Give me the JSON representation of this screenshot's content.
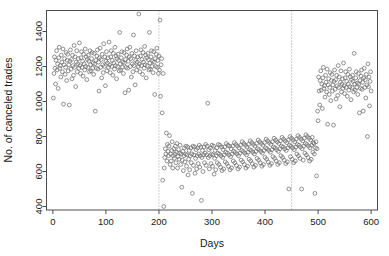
{
  "chart_data": {
    "type": "scatter",
    "title": "",
    "xlabel": "Days",
    "ylabel": "No. of canceled trades",
    "xlim": [
      -12,
      612
    ],
    "ylim": [
      380,
      1520
    ],
    "xticks": [
      0,
      100,
      200,
      300,
      400,
      500,
      600
    ],
    "yticks": [
      400,
      600,
      800,
      1000,
      1200,
      1400
    ],
    "grid": false,
    "legend": null,
    "point_style": {
      "marker": "open-circle",
      "radius": 1.9,
      "stroke": "#6e6e6e",
      "fill": "none"
    },
    "annotations": [
      {
        "type": "vline",
        "x": 200,
        "style": "dotted",
        "color": "#8a8a8a",
        "label": "changepoint-1"
      },
      {
        "type": "vline",
        "x": 450,
        "style": "dotted",
        "color": "#8a8a8a",
        "label": "changepoint-2"
      }
    ],
    "segments": [
      {
        "name": "regime-1",
        "x_range": [
          1,
          200
        ],
        "mean": 1200,
        "sd": 95
      },
      {
        "name": "regime-2",
        "x_range": [
          201,
          450
        ],
        "mean": 680,
        "sd": 78
      },
      {
        "name": "regime-3",
        "x_range": [
          451,
          600
        ],
        "mean": 1020,
        "sd": 90
      }
    ],
    "x": [
      1,
      2,
      3,
      4,
      5,
      6,
      7,
      8,
      9,
      10,
      11,
      12,
      13,
      14,
      15,
      16,
      17,
      18,
      19,
      20,
      21,
      22,
      23,
      24,
      25,
      26,
      27,
      28,
      29,
      30,
      31,
      32,
      33,
      34,
      35,
      36,
      37,
      38,
      39,
      40,
      41,
      42,
      43,
      44,
      45,
      46,
      47,
      48,
      49,
      50,
      51,
      52,
      53,
      54,
      55,
      56,
      57,
      58,
      59,
      60,
      61,
      62,
      63,
      64,
      65,
      66,
      67,
      68,
      69,
      70,
      71,
      72,
      73,
      74,
      75,
      76,
      77,
      78,
      79,
      80,
      81,
      82,
      83,
      84,
      85,
      86,
      87,
      88,
      89,
      90,
      91,
      92,
      93,
      94,
      95,
      96,
      97,
      98,
      99,
      100,
      101,
      102,
      103,
      104,
      105,
      106,
      107,
      108,
      109,
      110,
      111,
      112,
      113,
      114,
      115,
      116,
      117,
      118,
      119,
      120,
      121,
      122,
      123,
      124,
      125,
      126,
      127,
      128,
      129,
      130,
      131,
      132,
      133,
      134,
      135,
      136,
      137,
      138,
      139,
      140,
      141,
      142,
      143,
      144,
      145,
      146,
      147,
      148,
      149,
      150,
      151,
      152,
      153,
      154,
      155,
      156,
      157,
      158,
      159,
      160,
      161,
      162,
      163,
      164,
      165,
      166,
      167,
      168,
      169,
      170,
      171,
      172,
      173,
      174,
      175,
      176,
      177,
      178,
      179,
      180,
      181,
      182,
      183,
      184,
      185,
      186,
      187,
      188,
      189,
      190,
      191,
      192,
      193,
      194,
      195,
      196,
      197,
      198,
      199,
      200,
      201,
      202,
      203,
      204,
      205,
      206,
      207,
      208,
      209,
      210,
      211,
      212,
      213,
      214,
      215,
      216,
      217,
      218,
      219,
      220,
      221,
      222,
      223,
      224,
      225,
      226,
      227,
      228,
      229,
      230,
      231,
      232,
      233,
      234,
      235,
      236,
      237,
      238,
      239,
      240,
      241,
      242,
      243,
      244,
      245,
      246,
      247,
      248,
      249,
      250,
      251,
      252,
      253,
      254,
      255,
      256,
      257,
      258,
      259,
      260,
      261,
      262,
      263,
      264,
      265,
      266,
      267,
      268,
      269,
      270,
      271,
      272,
      273,
      274,
      275,
      276,
      277,
      278,
      279,
      280,
      281,
      282,
      283,
      284,
      285,
      286,
      287,
      288,
      289,
      290,
      291,
      292,
      293,
      294,
      295,
      296,
      297,
      298,
      299,
      300,
      301,
      302,
      303,
      304,
      305,
      306,
      307,
      308,
      309,
      310,
      311,
      312,
      313,
      314,
      315,
      316,
      317,
      318,
      319,
      320,
      321,
      322,
      323,
      324,
      325,
      326,
      327,
      328,
      329,
      330,
      331,
      332,
      333,
      334,
      335,
      336,
      337,
      338,
      339,
      340,
      341,
      342,
      343,
      344,
      345,
      346,
      347,
      348,
      349,
      350,
      351,
      352,
      353,
      354,
      355,
      356,
      357,
      358,
      359,
      360,
      361,
      362,
      363,
      364,
      365,
      366,
      367,
      368,
      369,
      370,
      371,
      372,
      373,
      374,
      375,
      376,
      377,
      378,
      379,
      380,
      381,
      382,
      383,
      384,
      385,
      386,
      387,
      388,
      389,
      390,
      391,
      392,
      393,
      394,
      395,
      396,
      397,
      398,
      399,
      400,
      401,
      402,
      403,
      404,
      405,
      406,
      407,
      408,
      409,
      410,
      411,
      412,
      413,
      414,
      415,
      416,
      417,
      418,
      419,
      420,
      421,
      422,
      423,
      424,
      425,
      426,
      427,
      428,
      429,
      430,
      431,
      432,
      433,
      434,
      435,
      436,
      437,
      438,
      439,
      440,
      441,
      442,
      443,
      444,
      445,
      446,
      447,
      448,
      449,
      450,
      451,
      452,
      453,
      454,
      455,
      456,
      457,
      458,
      459,
      460,
      461,
      462,
      463,
      464,
      465,
      466,
      467,
      468,
      469,
      470,
      471,
      472,
      473,
      474,
      475,
      476,
      477,
      478,
      479,
      480,
      481,
      482,
      483,
      484,
      485,
      486,
      487,
      488,
      489,
      490,
      491,
      492,
      493,
      494,
      495,
      496,
      497,
      498,
      499,
      500,
      501,
      502,
      503,
      504,
      505,
      506,
      507,
      508,
      509,
      510,
      511,
      512,
      513,
      514,
      515,
      516,
      517,
      518,
      519,
      520,
      521,
      522,
      523,
      524,
      525,
      526,
      527,
      528,
      529,
      530,
      531,
      532,
      533,
      534,
      535,
      536,
      537,
      538,
      539,
      540,
      541,
      542,
      543,
      544,
      545,
      546,
      547,
      548,
      549,
      550,
      551,
      552,
      553,
      554,
      555,
      556,
      557,
      558,
      559,
      560,
      561,
      562,
      563,
      564,
      565,
      566,
      567,
      568,
      569,
      570,
      571,
      572,
      573,
      574,
      575,
      576,
      577,
      578,
      579,
      580,
      581,
      582,
      583,
      584,
      585,
      586,
      587,
      588,
      589,
      590,
      591,
      592,
      593,
      594,
      595,
      596,
      597,
      598,
      599,
      600
    ],
    "y": [
      1020,
      1160,
      1255,
      1190,
      1100,
      1235,
      1290,
      1180,
      1215,
      1075,
      1250,
      1310,
      1190,
      1205,
      1140,
      1265,
      1225,
      1170,
      1300,
      985,
      1210,
      1245,
      1155,
      1195,
      1280,
      1120,
      1235,
      1270,
      1175,
      1210,
      980,
      1230,
      1295,
      1185,
      1240,
      1130,
      1265,
      1205,
      1150,
      1320,
      1195,
      1255,
      1085,
      1225,
      1290,
      1170,
      1215,
      1245,
      1190,
      1335,
      1205,
      1160,
      1250,
      1285,
      1195,
      1230,
      1145,
      1270,
      1215,
      1180,
      1300,
      1200,
      1255,
      1125,
      1240,
      1195,
      1265,
      1230,
      1170,
      1290,
      1210,
      1175,
      1245,
      1280,
      1190,
      1220,
      1155,
      1275,
      1215,
      945,
      1235,
      1190,
      1260,
      1295,
      1185,
      1225,
      1060,
      1250,
      1305,
      1195,
      1240,
      1135,
      1270,
      1210,
      1165,
      1330,
      1200,
      1255,
      1090,
      1230,
      1285,
      1175,
      1220,
      1250,
      1195,
      1340,
      1210,
      1165,
      1255,
      1290,
      1200,
      1235,
      1150,
      1275,
      1220,
      1185,
      1310,
      1205,
      1260,
      1130,
      1245,
      1200,
      1270,
      1235,
      1175,
      1395,
      1215,
      1180,
      1250,
      1285,
      1195,
      1225,
      1160,
      1280,
      1220,
      1050,
      1240,
      1195,
      1265,
      1300,
      1190,
      1230,
      1065,
      1255,
      1310,
      1200,
      1245,
      1140,
      1275,
      1215,
      1170,
      1380,
      1205,
      1260,
      1095,
      1235,
      1290,
      1180,
      1225,
      1255,
      1200,
      1500,
      1215,
      1170,
      1260,
      1295,
      1205,
      1240,
      1155,
      1280,
      1225,
      1190,
      1315,
      1210,
      1265,
      1135,
      1250,
      1205,
      1275,
      1240,
      1180,
      1395,
      1220,
      1185,
      1255,
      1290,
      1200,
      1230,
      1165,
      1285,
      1225,
      1040,
      1245,
      1200,
      1270,
      1305,
      1195,
      1235,
      1160,
      1260,
      1180,
      1465,
      1030,
      1210,
      1245,
      935,
      550,
      1160,
      400,
      620,
      680,
      730,
      700,
      820,
      660,
      755,
      715,
      690,
      745,
      805,
      640,
      700,
      660,
      720,
      770,
      620,
      690,
      730,
      675,
      700,
      745,
      650,
      710,
      760,
      620,
      685,
      725,
      670,
      705,
      750,
      640,
      700,
      510,
      665,
      715,
      605,
      690,
      735,
      655,
      700,
      745,
      630,
      695,
      740,
      580,
      670,
      720,
      610,
      690,
      735,
      650,
      700,
      475,
      745,
      635,
      695,
      740,
      590,
      675,
      725,
      615,
      690,
      735,
      645,
      700,
      750,
      625,
      690,
      740,
      435,
      680,
      720,
      600,
      695,
      740,
      650,
      705,
      755,
      635,
      695,
      745,
      990,
      680,
      725,
      615,
      690,
      735,
      645,
      700,
      750,
      630,
      695,
      745,
      585,
      675,
      720,
      610,
      690,
      735,
      650,
      705,
      755,
      640,
      700,
      750,
      625,
      690,
      740,
      605,
      680,
      725,
      615,
      695,
      740,
      655,
      710,
      760,
      645,
      705,
      750,
      630,
      695,
      745,
      610,
      685,
      730,
      620,
      700,
      745,
      660,
      715,
      765,
      650,
      710,
      755,
      635,
      700,
      745,
      615,
      690,
      735,
      625,
      705,
      750,
      665,
      720,
      770,
      655,
      715,
      760,
      640,
      705,
      750,
      620,
      695,
      740,
      630,
      710,
      755,
      670,
      725,
      775,
      660,
      720,
      765,
      645,
      710,
      755,
      625,
      700,
      745,
      635,
      715,
      760,
      675,
      730,
      780,
      665,
      725,
      770,
      650,
      715,
      760,
      630,
      705,
      750,
      640,
      720,
      765,
      680,
      735,
      785,
      670,
      730,
      775,
      655,
      720,
      765,
      635,
      710,
      755,
      645,
      725,
      770,
      685,
      740,
      790,
      675,
      735,
      780,
      660,
      725,
      770,
      640,
      715,
      760,
      650,
      730,
      775,
      690,
      745,
      795,
      680,
      740,
      785,
      665,
      730,
      775,
      645,
      720,
      765,
      655,
      735,
      780,
      500,
      750,
      800,
      685,
      745,
      790,
      670,
      735,
      780,
      650,
      725,
      770,
      660,
      740,
      785,
      700,
      755,
      805,
      690,
      750,
      795,
      675,
      740,
      785,
      500,
      730,
      775,
      665,
      745,
      790,
      705,
      760,
      810,
      695,
      755,
      800,
      680,
      745,
      790,
      660,
      735,
      780,
      670,
      750,
      795,
      710,
      765,
      760,
      700,
      475,
      735,
      770,
      575,
      730,
      945,
      890,
      1140,
      1060,
      980,
      1120,
      1175,
      1065,
      1100,
      960,
      1135,
      1195,
      1075,
      1090,
      1025,
      1150,
      1110,
      1055,
      1185,
      870,
      1095,
      1130,
      1040,
      1080,
      1165,
      1005,
      1120,
      1155,
      1060,
      1095,
      865,
      1115,
      1180,
      1070,
      1125,
      1015,
      1150,
      1090,
      1035,
      1205,
      1080,
      1140,
      970,
      1110,
      1175,
      1055,
      1100,
      1130,
      1075,
      1220,
      1090,
      1045,
      1135,
      1170,
      1080,
      1115,
      1030,
      1155,
      1100,
      1065,
      1185,
      1085,
      1140,
      1010,
      1125,
      1080,
      1150,
      1115,
      1055,
      1275,
      1100,
      1065,
      1135,
      1170,
      1080,
      1105,
      1040,
      1160,
      1100,
      935,
      1120,
      1075,
      1145,
      1180,
      1070,
      1110,
      945,
      1135,
      1190,
      1080,
      1125,
      1020,
      1155,
      1095,
      800,
      1215,
      1085,
      1140,
      975,
      1115,
      1170,
      1060,
      1105,
      1135,
      1080,
      1225,
      1100,
      1050,
      1140,
      1175,
      1085,
      1120,
      1035,
      1160,
      1105,
      1070,
      1190,
      1090,
      1145,
      1015,
      1130,
      1085,
      1155,
      1120,
      1060,
      1220,
      1105,
      1070,
      1140,
      1175,
      1085,
      1115,
      1045,
      1165,
      1105,
      775,
      1125,
      1080,
      1150,
      1185,
      1075,
      1115,
      950,
      1140,
      1195,
      1085,
      1130,
      1025,
      1160,
      1100,
      805,
      1210,
      1090,
      1145,
      980,
      1120,
      1175,
      1065,
      1110
    ]
  },
  "axes": {
    "y_tick_labels": [
      "400",
      "600",
      "800",
      "1000",
      "1200",
      "1400"
    ],
    "x_tick_labels": [
      "0",
      "100",
      "200",
      "300",
      "400",
      "500",
      "600"
    ],
    "x_axis_title": "Days",
    "y_axis_title": "No. of canceled trades"
  },
  "colors": {
    "background": "#ffffff",
    "frame": "#4d4d4d",
    "point_stroke": "#6e6e6e",
    "changepoint_line": "#8a8a8a",
    "text": "#1a1a1a"
  }
}
